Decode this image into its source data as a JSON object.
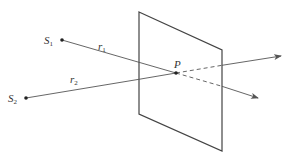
{
  "diagram": {
    "colors": {
      "line": "#555555",
      "plane": "#444444",
      "text": "#333333",
      "background": "#ffffff"
    },
    "plane": {
      "corners": [
        [
          139,
          12
        ],
        [
          222,
          50
        ],
        [
          222,
          151
        ],
        [
          139,
          114
        ]
      ]
    },
    "sources": [
      {
        "id": "S1",
        "label": "S",
        "subscript": "1",
        "x": 62,
        "y": 40
      },
      {
        "id": "S2",
        "label": "S",
        "subscript": "2",
        "x": 26,
        "y": 98
      }
    ],
    "point_P": {
      "label": "P",
      "x": 176,
      "y": 73
    },
    "rays": [
      {
        "id": "r1",
        "label": "r",
        "subscript": "1",
        "from": "S1",
        "through": "P",
        "arrow_end": [
          258,
          98
        ]
      },
      {
        "id": "r2",
        "label": "r",
        "subscript": "2",
        "from": "S2",
        "through": "P",
        "arrow_end": [
          281,
          56
        ]
      }
    ]
  }
}
